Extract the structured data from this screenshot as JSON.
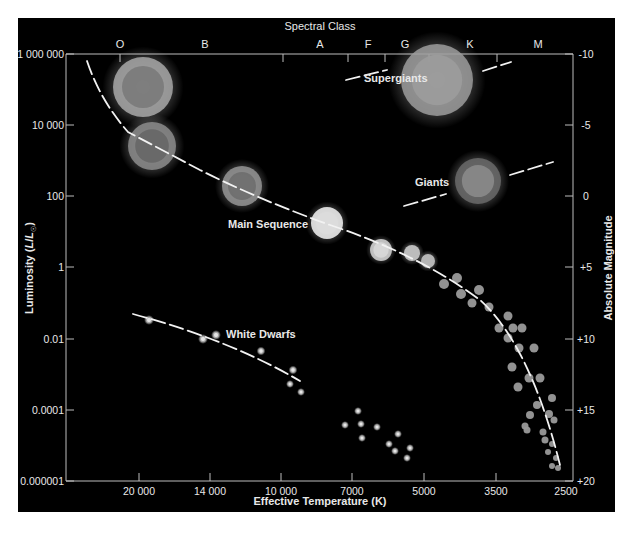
{
  "chart_data": {
    "type": "scatter",
    "top_axis": {
      "label": "Spectral Class",
      "ticks": [
        {
          "label": "O",
          "x": 120
        },
        {
          "label": "B",
          "x": 205
        },
        {
          "label": "A",
          "x": 320
        },
        {
          "label": "F",
          "x": 368
        },
        {
          "label": "G",
          "x": 405
        },
        {
          "label": "K",
          "x": 470
        },
        {
          "label": "M",
          "x": 538
        }
      ],
      "tick_marks_x": [
        120,
        283,
        348,
        385,
        429,
        497
      ]
    },
    "xlabel": "Effective Temperature (K)",
    "x_ticks": [
      {
        "label": "20 000",
        "x": 139
      },
      {
        "label": "14 000",
        "x": 210
      },
      {
        "label": "10 000",
        "x": 281
      },
      {
        "label": "7000",
        "x": 352
      },
      {
        "label": "5000",
        "x": 424
      },
      {
        "label": "3500",
        "x": 496
      },
      {
        "label": "2500",
        "x": 566
      }
    ],
    "ylabel": "Luminosity (L/L☉)",
    "y_ticks": [
      {
        "label": "1 000 000",
        "y": 54
      },
      {
        "label": "10 000",
        "y": 125
      },
      {
        "label": "100",
        "y": 196
      },
      {
        "label": "1",
        "y": 267
      },
      {
        "label": "0.01",
        "y": 339
      },
      {
        "label": "0.0001",
        "y": 410
      },
      {
        "label": "0.000001",
        "y": 481
      }
    ],
    "y2label": "Absolute Magnitude",
    "y2_ticks": [
      {
        "label": "-10",
        "y": 54
      },
      {
        "label": "-5",
        "y": 125
      },
      {
        "label": "0",
        "y": 196
      },
      {
        "label": "+5",
        "y": 267
      },
      {
        "label": "+10",
        "y": 339
      },
      {
        "label": "+15",
        "y": 410
      },
      {
        "label": "+20",
        "y": 481
      }
    ],
    "xlim": [
      40000,
      2500
    ],
    "ylim": [
      1e-06,
      1000000
    ],
    "grid": false,
    "annotations": [
      {
        "text": "Supergiants",
        "x": 364,
        "y": 82
      },
      {
        "text": "Giants",
        "x": 415,
        "y": 186
      },
      {
        "text": "Main Sequence",
        "x": 228,
        "y": 228
      },
      {
        "text": "White Dwarfs",
        "x": 226,
        "y": 338
      }
    ],
    "series": [
      {
        "name": "Supergiants",
        "points": [
          {
            "x": 143,
            "y": 87,
            "r": 30,
            "core": "#7a7a7a",
            "ring": "#a8a8a8"
          },
          {
            "x": 437,
            "y": 80,
            "r": 36,
            "core": "#9c9c9c",
            "ring": "#9c9c9c"
          }
        ]
      },
      {
        "name": "Giants",
        "points": [
          {
            "x": 478,
            "y": 181,
            "r": 23,
            "core": "#8a8a8a",
            "ring": "#6a6a6a"
          }
        ]
      },
      {
        "name": "Main Sequence",
        "points": [
          {
            "x": 152,
            "y": 146,
            "r": 24,
            "core": "#666666",
            "ring": "#8c8c8c"
          },
          {
            "x": 242,
            "y": 186,
            "r": 20,
            "core": "#6e6e6e",
            "ring": "#959595"
          },
          {
            "x": 327,
            "y": 223,
            "r": 16,
            "core": "#dcdcdc",
            "ring": "#f4f4f4"
          },
          {
            "x": 381,
            "y": 250,
            "r": 11,
            "core": "#d8d8d8",
            "ring": "#d8d8d8"
          },
          {
            "x": 412,
            "y": 253,
            "r": 8,
            "core": "#bcbcbc",
            "ring": "#bcbcbc"
          },
          {
            "x": 428,
            "y": 261,
            "r": 7,
            "core": "#b5b5b5",
            "ring": "#b5b5b5"
          },
          {
            "x": 444,
            "y": 284,
            "r": 5,
            "core": "#9a9a9a"
          },
          {
            "x": 457,
            "y": 278,
            "r": 5,
            "core": "#9a9a9a"
          },
          {
            "x": 461,
            "y": 294,
            "r": 5,
            "core": "#9a9a9a"
          },
          {
            "x": 479,
            "y": 290,
            "r": 5,
            "core": "#9a9a9a"
          },
          {
            "x": 472,
            "y": 303,
            "r": 4.5,
            "core": "#9a9a9a"
          },
          {
            "x": 489,
            "y": 307,
            "r": 4.5,
            "core": "#9a9a9a"
          },
          {
            "x": 508,
            "y": 316,
            "r": 4.5,
            "core": "#9a9a9a"
          },
          {
            "x": 499,
            "y": 328,
            "r": 4.5,
            "core": "#9a9a9a"
          },
          {
            "x": 513,
            "y": 328,
            "r": 4.5,
            "core": "#9a9a9a"
          },
          {
            "x": 522,
            "y": 328,
            "r": 4.5,
            "core": "#9a9a9a"
          },
          {
            "x": 508,
            "y": 338,
            "r": 4.5,
            "core": "#9a9a9a"
          },
          {
            "x": 519,
            "y": 348,
            "r": 4.5,
            "core": "#9a9a9a"
          },
          {
            "x": 534,
            "y": 348,
            "r": 4.5,
            "core": "#9a9a9a"
          },
          {
            "x": 512,
            "y": 367,
            "r": 4.5,
            "core": "#9a9a9a"
          },
          {
            "x": 529,
            "y": 378,
            "r": 4.5,
            "core": "#9a9a9a"
          },
          {
            "x": 540,
            "y": 378,
            "r": 4.5,
            "core": "#9a9a9a"
          },
          {
            "x": 518,
            "y": 387,
            "r": 4.5,
            "core": "#9a9a9a"
          },
          {
            "x": 537,
            "y": 405,
            "r": 4,
            "core": "#9a9a9a"
          },
          {
            "x": 552,
            "y": 398,
            "r": 4,
            "core": "#9a9a9a"
          },
          {
            "x": 530,
            "y": 415,
            "r": 4,
            "core": "#9a9a9a"
          },
          {
            "x": 549,
            "y": 414,
            "r": 4,
            "core": "#9a9a9a"
          },
          {
            "x": 525,
            "y": 426,
            "r": 3.5,
            "core": "#9a9a9a"
          },
          {
            "x": 527,
            "y": 430,
            "r": 3.5,
            "core": "#9a9a9a"
          },
          {
            "x": 543,
            "y": 432,
            "r": 3.5,
            "core": "#9a9a9a"
          },
          {
            "x": 554,
            "y": 420,
            "r": 3.5,
            "core": "#9a9a9a"
          },
          {
            "x": 545,
            "y": 440,
            "r": 3.5,
            "core": "#9a9a9a"
          },
          {
            "x": 552,
            "y": 444,
            "r": 3,
            "core": "#9a9a9a"
          },
          {
            "x": 548,
            "y": 452,
            "r": 3,
            "core": "#9a9a9a"
          },
          {
            "x": 556,
            "y": 458,
            "r": 3,
            "core": "#9a9a9a"
          },
          {
            "x": 552,
            "y": 466,
            "r": 3,
            "core": "#9a9a9a"
          },
          {
            "x": 558,
            "y": 468,
            "r": 3,
            "core": "#9a9a9a"
          }
        ]
      },
      {
        "name": "White Dwarfs",
        "points": [
          {
            "x": 149,
            "y": 320,
            "r": 3.5
          },
          {
            "x": 203,
            "y": 339,
            "r": 3.5
          },
          {
            "x": 216,
            "y": 335,
            "r": 3.5
          },
          {
            "x": 261,
            "y": 351,
            "r": 3
          },
          {
            "x": 293,
            "y": 370,
            "r": 3
          },
          {
            "x": 290,
            "y": 384,
            "r": 2.5
          },
          {
            "x": 301,
            "y": 392,
            "r": 2.5
          }
        ]
      },
      {
        "name": "Faint dwarfs",
        "points": [
          {
            "x": 358,
            "y": 411
          },
          {
            "x": 345,
            "y": 425
          },
          {
            "x": 361,
            "y": 424
          },
          {
            "x": 377,
            "y": 427
          },
          {
            "x": 362,
            "y": 438
          },
          {
            "x": 398,
            "y": 434
          },
          {
            "x": 389,
            "y": 444
          },
          {
            "x": 395,
            "y": 451
          },
          {
            "x": 410,
            "y": 448
          },
          {
            "x": 407,
            "y": 458
          }
        ]
      }
    ],
    "curves": [
      {
        "name": "Main Sequence",
        "path": "M 87 61 Q 100 100 128 132 L 200 170 Q 260 200 330 225 Q 420 255 480 300 Q 530 345 560 465",
        "dashed": true
      },
      {
        "name": "White Dwarfs",
        "path": "M 133 314 Q 230 340 300 381",
        "dashed": true
      },
      {
        "name": "Supergiants left",
        "path": "M 346 80 L 387 70",
        "dashed": true
      },
      {
        "name": "Supergiants right",
        "path": "M 483 71 L 511 62",
        "dashed": true
      },
      {
        "name": "Giants left",
        "path": "M 404 206 L 446 194",
        "dashed": true
      },
      {
        "name": "Giants right",
        "path": "M 510 175 L 553 162",
        "dashed": true
      }
    ]
  },
  "colors": {
    "background": "#000000",
    "page": "#ffffff",
    "text": "#e8e8e8",
    "axis": "#bdbdbd",
    "curve": "#f2f2f2"
  }
}
